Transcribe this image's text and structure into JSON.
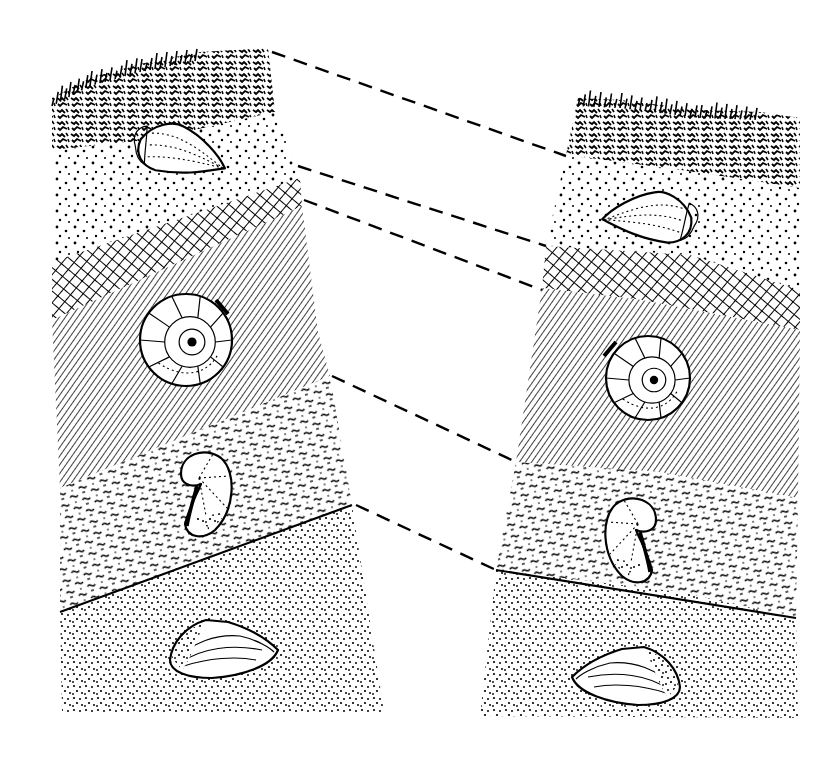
{
  "diagram": {
    "title": "Stratigraphic correlation of rock layers by index fossils",
    "colors": {
      "ink": "#000000",
      "paper": "#ffffff"
    },
    "columns": [
      {
        "id": "left",
        "label": "Left rock column",
        "layers": [
          {
            "name": "soil-vegetation",
            "pattern": "soil",
            "points": "52,98 90,78 140,64 200,52 268,48 275,112 150,140 52,150"
          },
          {
            "name": "sand",
            "pattern": "dots",
            "fossil": "cone-shell",
            "points": "52,150 150,140 275,112 298,170 300,178 52,262"
          },
          {
            "name": "crosshatch-band",
            "pattern": "crosshatch",
            "points": "52,262 300,178 302,206 52,320"
          },
          {
            "name": "shale",
            "pattern": "hatch",
            "fossil": "ammonite",
            "points": "52,320 302,206 318,332 330,376 60,488"
          },
          {
            "name": "wavy-siltstone",
            "pattern": "wavy",
            "fossil": "coiled-shell",
            "points": "60,488 330,376 352,505 60,612"
          },
          {
            "name": "stippled-sandstone",
            "pattern": "stipple",
            "fossil": "clam",
            "points": "60,612 352,505 384,712 62,712"
          }
        ]
      },
      {
        "id": "right",
        "label": "Right rock column",
        "layers": [
          {
            "name": "soil-vegetation",
            "pattern": "soil",
            "points": "578,98 620,100 700,110 760,112 800,118 800,188 680,170 566,155"
          },
          {
            "name": "sand",
            "pattern": "dots",
            "fossil": "cone-shell",
            "points": "566,155 680,170 800,188 800,290 690,255 546,246"
          },
          {
            "name": "crosshatch-band",
            "pattern": "crosshatch",
            "points": "546,246 690,255 800,290 800,330 642,300 542,288"
          },
          {
            "name": "shale",
            "pattern": "hatch",
            "fossil": "ammonite",
            "points": "542,288 642,300 800,330 798,498 660,472 516,462"
          },
          {
            "name": "wavy-siltstone",
            "pattern": "wavy",
            "fossil": "coiled-shell",
            "points": "516,462 660,472 798,498 796,618 680,592 496,570"
          },
          {
            "name": "stippled-sandstone",
            "pattern": "stipple",
            "fossil": "clam",
            "points": "496,570 680,592 796,618 798,718 480,716"
          }
        ]
      }
    ],
    "correlation_lines": [
      {
        "name": "correlation-top-soil",
        "x1": 272,
        "y1": 52,
        "x2": 566,
        "y2": 156
      },
      {
        "name": "correlation-sand-base",
        "x1": 298,
        "y1": 166,
        "x2": 546,
        "y2": 246
      },
      {
        "name": "correlation-crosshatch-base",
        "x1": 304,
        "y1": 200,
        "x2": 542,
        "y2": 290
      },
      {
        "name": "correlation-shale-base",
        "x1": 332,
        "y1": 376,
        "x2": 516,
        "y2": 462
      },
      {
        "name": "correlation-wavy-base",
        "x1": 356,
        "y1": 505,
        "x2": 496,
        "y2": 570
      }
    ],
    "fossils": [
      {
        "name": "cone-shell",
        "column": "left",
        "x": 178,
        "y": 158
      },
      {
        "name": "ammonite",
        "column": "left",
        "x": 186,
        "y": 340
      },
      {
        "name": "coiled-shell",
        "column": "left",
        "x": 205,
        "y": 488
      },
      {
        "name": "clam",
        "column": "left",
        "x": 222,
        "y": 648
      },
      {
        "name": "cone-shell",
        "column": "right",
        "x": 650,
        "y": 224
      },
      {
        "name": "ammonite",
        "column": "right",
        "x": 648,
        "y": 378
      },
      {
        "name": "coiled-shell",
        "column": "right",
        "x": 632,
        "y": 534
      },
      {
        "name": "clam",
        "column": "right",
        "x": 628,
        "y": 675
      }
    ]
  }
}
